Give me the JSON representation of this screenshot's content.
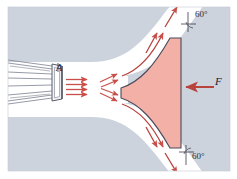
{
  "figure": {
    "background_color": "#ffffff",
    "field_color": "#ccd3dd",
    "vane_fill": "#f2b0a6",
    "vane_stroke": "#4a4a5a",
    "jet_color": "#c9504a",
    "pipe_color": "#8a8f9c"
  },
  "labels": {
    "nozzle_area": "A",
    "force": "F",
    "angle_top": "60°",
    "angle_bottom": "60°"
  },
  "annotations": {
    "jet_direction": "right",
    "force_direction": "left",
    "deflection_angle_deg": 60
  }
}
